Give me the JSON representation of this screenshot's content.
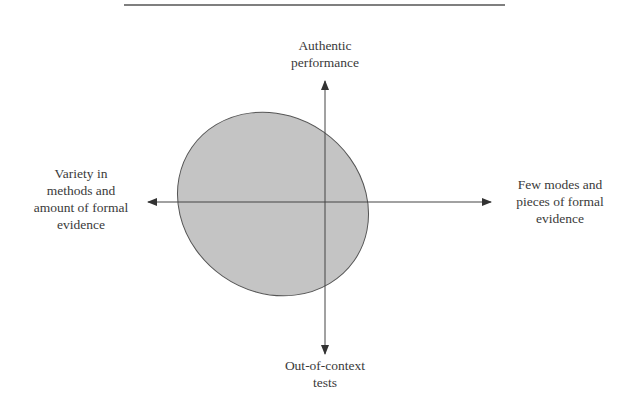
{
  "diagram": {
    "type": "quadrant-axes-with-ellipse",
    "labels": {
      "top": [
        "Authentic",
        "performance"
      ],
      "bottom": [
        "Out-of-context",
        "tests"
      ],
      "left": [
        "Variety in",
        "methods and",
        "amount of formal",
        "evidence"
      ],
      "right": [
        "Few modes and",
        "pieces of formal",
        "evidence"
      ]
    },
    "colors": {
      "ellipse_fill": "#c4c4c4",
      "stroke": "#3a3a3a",
      "rule": "#555555",
      "text": "#3a3a3a"
    }
  }
}
